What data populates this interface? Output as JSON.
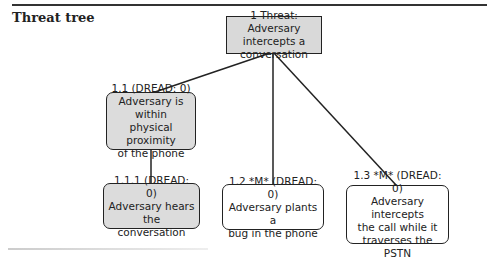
{
  "title": "Threat tree",
  "nodes": {
    "root": {
      "id": "1",
      "lines": [
        "1 Threat: Adversary",
        "intercepts a",
        "conversation"
      ]
    },
    "n1_1": {
      "id": "1.1",
      "lines": [
        "1.1 (DREAD: 0)",
        "Adversary is within",
        "physical proximity",
        "of the phone"
      ]
    },
    "n1_1_1": {
      "id": "1.1.1",
      "lines": [
        "1.1.1 (DREAD: 0)",
        "Adversary hears the",
        "conversation"
      ]
    },
    "n1_2": {
      "id": "1.2",
      "lines": [
        "1.2 *M* (DREAD: 0)",
        "Adversary plants a",
        "bug in the phone"
      ]
    },
    "n1_3": {
      "id": "1.3",
      "lines": [
        "1.3 *M* (DREAD: 0)",
        "Adversary intercepts",
        "the call while it",
        "traverses the PSTN"
      ]
    }
  },
  "colors": {
    "shaded_fill": "#dcdcdc",
    "stroke": "#222222"
  }
}
